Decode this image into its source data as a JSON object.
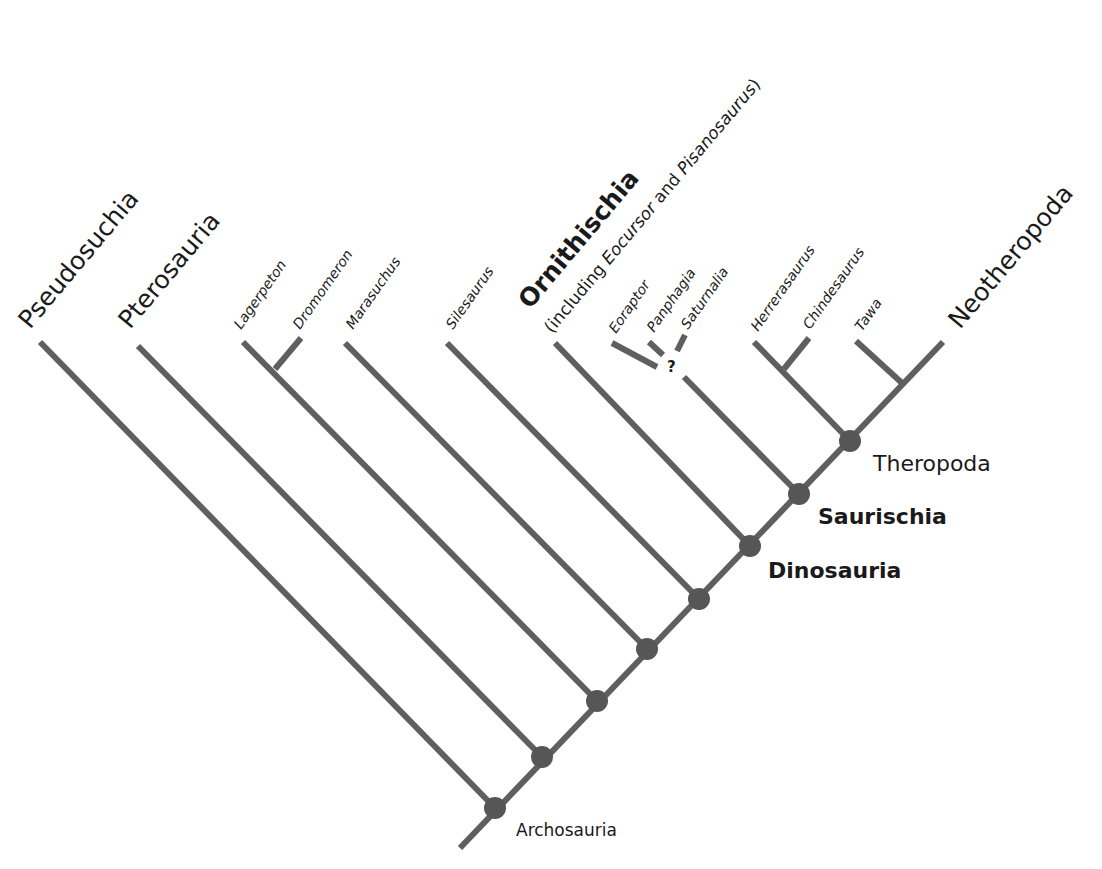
{
  "diagram": {
    "type": "cladogram",
    "title": "",
    "colors": {
      "branch": "#5f5f5f",
      "node": "#565656",
      "text": "#1a1a1a",
      "background": "#ffffff"
    },
    "tips": {
      "pseudosuchia": "Pseudosuchia",
      "pterosauria": "Pterosauria",
      "lagerpeton": "Lagerpeton",
      "dromomeron": "Dromomeron",
      "marasuchus": "Marasuchus",
      "silesaurus": "Silesaurus",
      "ornithischia": "Ornithischia",
      "ornithischia_note_prefix": "(including ",
      "ornithischia_note_eocursor": "Eocursor",
      "ornithischia_note_and": " and ",
      "ornithischia_note_pisanosaurus": "Pisanosaurus",
      "ornithischia_note_suffix": ")",
      "eoraptor": "Eoraptor",
      "panphagia": "Panphagia",
      "saturnalia": "Saturnalia",
      "herrerasaurus": "Herrerasaurus",
      "chindesaurus": "Chindesaurus",
      "tawa": "Tawa",
      "neotheropoda": "Neotheropoda"
    },
    "clades": {
      "archosauria": "Archosauria",
      "dinosauria": "Dinosauria",
      "saurischia": "Saurischia",
      "theropoda": "Theropoda"
    },
    "uncertainty_marker": "?"
  }
}
